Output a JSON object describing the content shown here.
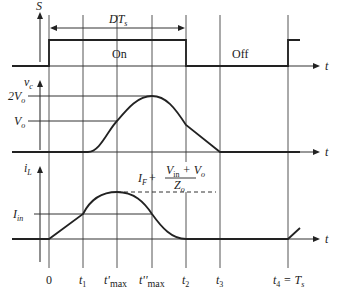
{
  "figure": {
    "panels": [
      {
        "id": "switch",
        "y_label": "S",
        "x_label": "t",
        "interval_label": "DT",
        "interval_label_sub": "s",
        "state_labels": {
          "on": "On",
          "off": "Off"
        }
      },
      {
        "id": "capacitor-voltage",
        "y_label": "v",
        "y_label_sub": "c",
        "x_label": "t",
        "levels": [
          {
            "label": "2V",
            "sub": "o"
          },
          {
            "label": "V",
            "sub": "o"
          }
        ]
      },
      {
        "id": "inductor-current",
        "y_label": "i",
        "y_label_sub": "L",
        "x_label": "t",
        "levels": [
          {
            "label": "I",
            "sub": "in"
          }
        ],
        "peak_label": {
          "prefix": "I",
          "prefix_sub": "F",
          "plus": "+",
          "numerator": "V",
          "numerator_sub": "in",
          "numerator_rest": " + V",
          "numerator_rest_sub": "o",
          "denominator": "Z",
          "denominator_sub": "o"
        }
      }
    ],
    "time_markers": [
      {
        "label": "0",
        "sub": ""
      },
      {
        "label": "t",
        "sub": "1"
      },
      {
        "label": "t'",
        "sub": "max"
      },
      {
        "label": "t''",
        "sub": "max"
      },
      {
        "label": "t",
        "sub": "2"
      },
      {
        "label": "t",
        "sub": "3"
      },
      {
        "label": "t",
        "sub": "4",
        "suffix": " = T",
        "suffix_sub": "s"
      }
    ]
  }
}
